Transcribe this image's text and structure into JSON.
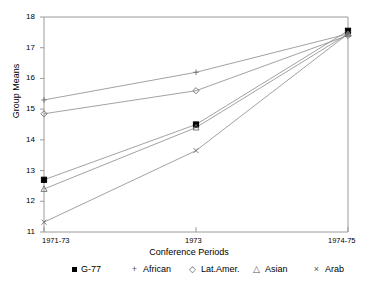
{
  "chart_data": {
    "type": "line",
    "title": "",
    "xlabel": "Conference Periods",
    "ylabel": "Group Means",
    "categories": [
      "1971-73",
      "1973",
      "1974-75"
    ],
    "ylim": [
      11,
      18
    ],
    "yticks": [
      11,
      12,
      13,
      14,
      15,
      16,
      17,
      18
    ],
    "grid": false,
    "legend_position": "bottom",
    "series": [
      {
        "name": "G-77",
        "marker": "filled-square",
        "values": [
          12.7,
          14.5,
          17.55
        ]
      },
      {
        "name": "African",
        "marker": "plus",
        "values": [
          15.3,
          16.2,
          17.45
        ]
      },
      {
        "name": "Lat.Amer.",
        "marker": "diamond",
        "values": [
          14.85,
          15.6,
          17.4
        ]
      },
      {
        "name": "Asian",
        "marker": "triangle",
        "values": [
          12.4,
          14.4,
          17.45
        ]
      },
      {
        "name": "Arab",
        "marker": "cross",
        "values": [
          11.32,
          13.65,
          17.45
        ]
      }
    ]
  },
  "axes": {
    "ytick_labels": [
      "18",
      "17",
      "16",
      "15",
      "14",
      "13",
      "12",
      "11"
    ],
    "xtick_labels": [
      "1971-73",
      "1973",
      "1974-75"
    ],
    "y_axis_title": "Group Means",
    "x_axis_title": "Conference Periods"
  },
  "legend": {
    "items": [
      {
        "label": "G-77",
        "marker": "filled-square",
        "glyph": ""
      },
      {
        "label": "African",
        "marker": "plus",
        "glyph": "+"
      },
      {
        "label": "Lat.Amer.",
        "marker": "diamond",
        "glyph": "◇"
      },
      {
        "label": "Asian",
        "marker": "triangle",
        "glyph": "△"
      },
      {
        "label": "Arab",
        "marker": "cross",
        "glyph": "×"
      }
    ]
  },
  "colors": {
    "line": "#8a8a8a",
    "axis": "#9a9a9a",
    "text": "#000000",
    "marker": "#6d6d6d",
    "g77_marker": "#000000"
  }
}
